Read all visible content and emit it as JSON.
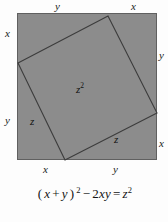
{
  "figure": {
    "colors": {
      "square_fill": "#8c8c8c",
      "square_stroke": "#5a5a5a",
      "inner_stroke": "#3c3c3c",
      "background": "#fdfdfd",
      "text": "#141414"
    },
    "outer_square": {
      "name": "outer-square",
      "side_label_note": "each side split into segments x and y",
      "x": 17,
      "y": 13,
      "width": 140,
      "height": 147
    },
    "inner_square": {
      "name": "inner-square",
      "vertices": [
        {
          "x": 108,
          "y": 16
        },
        {
          "x": 157,
          "y": 113
        },
        {
          "x": 65,
          "y": 160
        },
        {
          "x": 18,
          "y": 63
        }
      ]
    },
    "labels": {
      "top_left": "y",
      "top_right": "x",
      "left_top": "x",
      "left_bottom": "y",
      "right_top": "y",
      "right_bottom": "x",
      "bottom_left": "x",
      "bottom_right": "y",
      "center": "z",
      "center_exponent": "2",
      "inner_edge_left": "z",
      "inner_edge_right": "z"
    }
  },
  "equation": {
    "full_text": "(x + y)^2 - 2xy = z^2",
    "parts": {
      "open_paren": "(",
      "var_x": "x",
      "plus": "+",
      "var_y": "y",
      "close_paren": ")",
      "exp_two_a": "2",
      "minus": "−",
      "coeff_two": "2",
      "var_xy": "xy",
      "equals": "=",
      "var_z": "z",
      "exp_two_b": "2"
    }
  }
}
